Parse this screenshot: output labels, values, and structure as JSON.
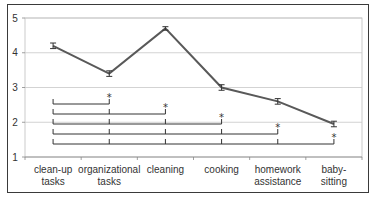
{
  "chart_data": {
    "type": "line",
    "title": "",
    "xlabel": "",
    "ylabel": "",
    "ylim": [
      1,
      5
    ],
    "yticks": [
      1,
      2,
      3,
      4,
      5
    ],
    "grid": true,
    "legend": null,
    "categories": [
      "clean-up tasks",
      "organizational tasks",
      "cleaning",
      "cooking",
      "homework assistance",
      "baby-sitting"
    ],
    "category_lines": [
      [
        "clean-up",
        "tasks"
      ],
      [
        "organizational",
        "tasks"
      ],
      [
        "cleaning"
      ],
      [
        "cooking"
      ],
      [
        "homework",
        "assistance"
      ],
      [
        "baby-",
        "sitting"
      ]
    ],
    "series": [
      {
        "name": "mean",
        "values": [
          4.2,
          3.4,
          4.7,
          3.0,
          2.6,
          1.95
        ],
        "error": [
          0.08,
          0.08,
          0.05,
          0.08,
          0.08,
          0.08
        ],
        "color": "#595959"
      }
    ],
    "annotations": [
      {
        "type": "significance-bracket",
        "from": "clean-up tasks",
        "to": "organizational tasks",
        "label": "*"
      },
      {
        "type": "significance-bracket",
        "from": "clean-up tasks",
        "to": "cleaning",
        "label": "*"
      },
      {
        "type": "significance-bracket",
        "from": "clean-up tasks",
        "to": "cooking",
        "label": "*"
      },
      {
        "type": "significance-bracket",
        "from": "clean-up tasks",
        "to": "homework assistance",
        "label": "*"
      },
      {
        "type": "significance-bracket",
        "from": "clean-up tasks",
        "to": "baby-sitting",
        "label": "*"
      }
    ]
  }
}
